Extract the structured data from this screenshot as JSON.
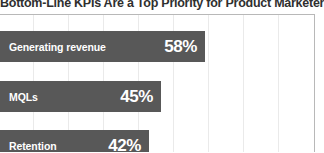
{
  "chart_title": "Bottom-Line KPIs Are a Top Priority for Product Marketers",
  "colors": {
    "bar": "#585858",
    "bar_text": "#ffffff",
    "title": "#2f2f2f",
    "gridline": "#eaeaea",
    "plot_border": "#b8b8b8",
    "background": "#ffffff"
  },
  "chart_data": {
    "type": "bar",
    "orientation": "horizontal",
    "title": "Bottom-Line KPIs Are a Top Priority for Product Marketers",
    "xlabel": "",
    "ylabel": "",
    "categories": [
      "Generating revenue",
      "MQLs",
      "Retention"
    ],
    "values": [
      58,
      45,
      42
    ],
    "value_labels": [
      "58%",
      "45%",
      "42%"
    ],
    "xlim": [
      0,
      90
    ],
    "grid": true,
    "legend": false,
    "note": "Chart is cropped: left edge of bars and the bottom of the third bar extend beyond the visible frame."
  },
  "bars": [
    {
      "label": "Generating revenue",
      "value_label": "58%",
      "value": 58,
      "top": 16,
      "height": 31,
      "width": 205
    },
    {
      "label": "MQLs",
      "value_label": "45%",
      "value": 45,
      "top": 66,
      "height": 31,
      "width": 161
    },
    {
      "label": "Retention",
      "value_label": "42%",
      "value": 42,
      "top": 115,
      "height": 31,
      "width": 149
    }
  ],
  "gridlines": [
    33,
    68,
    103,
    138,
    173,
    208,
    243,
    278
  ]
}
